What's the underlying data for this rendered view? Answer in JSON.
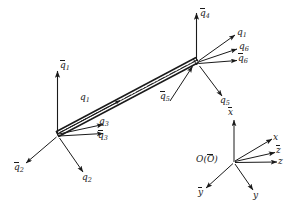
{
  "figure": {
    "type": "engineering-diagram",
    "stroke_color": "#1a1a1a",
    "background_color": "#ffffff",
    "beam": {
      "name": "beam-element",
      "start_node": "left-node",
      "end_node": "right-node",
      "centerline_style": "dash-dot"
    }
  },
  "labels": {
    "q1_bar": "q",
    "q1_bar_sub": "1",
    "q1": "q",
    "q1_sub": "1",
    "q2_bar": "q",
    "q2_bar_sub": "2",
    "q2": "q",
    "q2_sub": "2",
    "q3": "q",
    "q3_sub": "3",
    "q3_bar": "q",
    "q3_bar_sub": "3",
    "q4_bar": "q",
    "q4_bar_sub": "4",
    "q5_bar": "q",
    "q5_bar_sub": "5",
    "q5": "q",
    "q5_sub": "5",
    "q6_top": "q",
    "q6_top_sub": "1",
    "q6": "q",
    "q6_sub": "6",
    "q6_bar": "q",
    "q6_bar_sub": "6"
  },
  "axes": {
    "origin": "O(O)",
    "origin_plain": "O(",
    "origin_bar": "O",
    "origin_close": ")",
    "x_bar": "x",
    "x": "x",
    "z_bar": "z",
    "z": "z",
    "y_bar": "y",
    "y": "y"
  }
}
